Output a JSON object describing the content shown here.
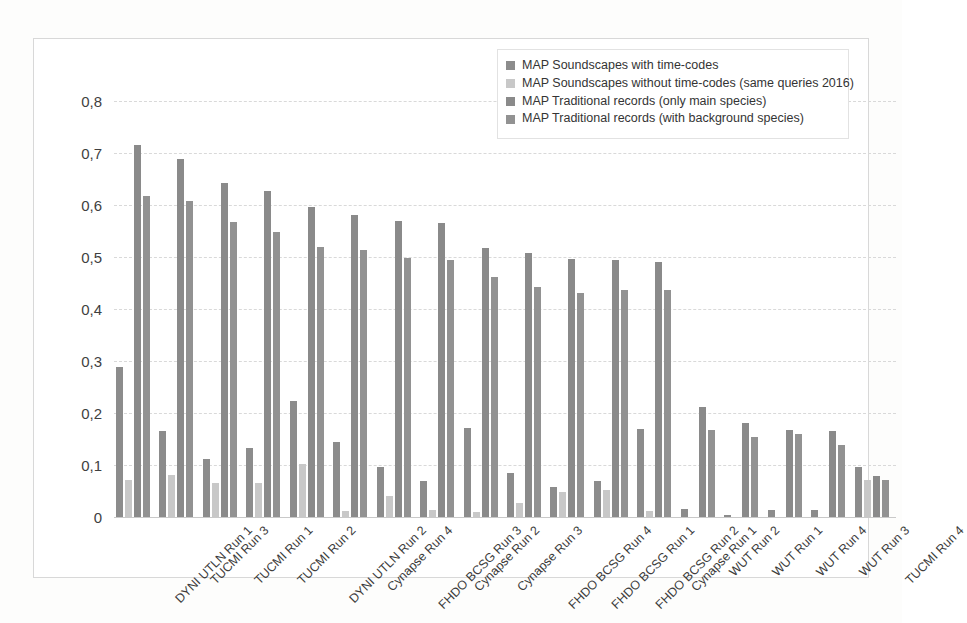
{
  "chart_data": {
    "type": "bar",
    "title": "",
    "xlabel": "",
    "ylabel": "",
    "ylim": [
      0,
      0.8
    ],
    "ytick_labels": [
      "0,8",
      "0,7",
      "0,6",
      "0,5",
      "0,4",
      "0,3",
      "0,2",
      "0,1",
      "0"
    ],
    "ytick_values": [
      0.8,
      0.7,
      0.6,
      0.5,
      0.4,
      0.3,
      0.2,
      0.1,
      0
    ],
    "grid": true,
    "legend_position": "top-right",
    "categories": [
      "DYNI UTLN Run 1",
      "TUCMI Run 3",
      "TUCMI Run 1",
      "TUCMI Run 2",
      "DYNI UTLN Run 2",
      "Cynapse Run 4",
      "FHDO BCSG Run 3",
      "Cynapse Run 2",
      "Cynapse Run 3",
      "FHDO BCSG Run 4",
      "FHDO BCSG Run 1",
      "FHDO BCSG Run 2",
      "Cynapse Run 1",
      "WUT Run 2",
      "WUT Run 1",
      "WUT Run 4",
      "WUT Run 3",
      "TUCMI Run 4"
    ],
    "series": [
      {
        "name": "MAP Soundscapes with time-codes",
        "color": "#8c8c8c",
        "values": [
          0.289,
          0.166,
          0.111,
          0.133,
          0.224,
          0.144,
          0.096,
          0.069,
          0.171,
          0.085,
          0.057,
          0.07,
          0.17,
          0.016,
          0.003,
          0.013,
          0.013,
          0.096
        ]
      },
      {
        "name": "MAP Soundscapes without time-codes (same queries 2016)",
        "color": "#c8c8c8",
        "values": [
          0.072,
          0.08,
          0.065,
          0.066,
          0.101,
          0.012,
          0.041,
          0.014,
          0.01,
          0.026,
          0.049,
          0.051,
          0.012,
          0.0,
          0.0,
          0.0,
          0.0,
          0.072
        ]
      },
      {
        "name": "MAP Traditional records (only main species)",
        "color": "#8a8a8a",
        "values": [
          0.715,
          0.688,
          0.643,
          0.626,
          0.596,
          0.58,
          0.569,
          0.565,
          0.517,
          0.508,
          0.496,
          0.495,
          0.491,
          0.212,
          0.181,
          0.168,
          0.165,
          0.078
        ]
      },
      {
        "name": "MAP Traditional records (with background species)",
        "color": "#929292",
        "values": [
          0.618,
          0.607,
          0.567,
          0.549,
          0.519,
          0.513,
          0.498,
          0.494,
          0.461,
          0.442,
          0.431,
          0.436,
          0.437,
          0.167,
          0.154,
          0.159,
          0.139,
          0.071
        ]
      }
    ]
  }
}
